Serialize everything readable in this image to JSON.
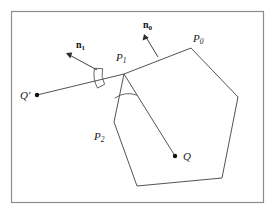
{
  "figure": {
    "background_color": "#ffffff",
    "border_color": "#8c8c8c",
    "line_color": "#3a3a3a",
    "label_color": "#1a1a1a",
    "frame": {
      "x": 11,
      "y": 11,
      "width": 253,
      "height": 192
    }
  },
  "labels": {
    "p0": {
      "text": "P",
      "sub": "0",
      "x": 193,
      "y": 33
    },
    "p1": {
      "text": "P",
      "sub": "1",
      "x": 116,
      "y": 52
    },
    "p2": {
      "text": "P",
      "sub": "2",
      "x": 94,
      "y": 131
    },
    "q": {
      "text": "Q",
      "sub": "",
      "x": 183,
      "y": 151
    },
    "qprime": {
      "text": "Q",
      "sub": "",
      "prime": "′",
      "x": 20,
      "y": 90
    },
    "n0": {
      "text": "n",
      "sub": "0",
      "x": 143,
      "y": 20
    },
    "n1": {
      "text": "n",
      "sub": "1",
      "x": 76,
      "y": 40
    }
  },
  "geometry": {
    "polygon_vertices": [
      {
        "name": "P1",
        "x": 124,
        "y": 74
      },
      {
        "name": "P0",
        "x": 191,
        "y": 48
      },
      {
        "name": "V3",
        "x": 238,
        "y": 97
      },
      {
        "name": "V4",
        "x": 222,
        "y": 178
      },
      {
        "name": "V5",
        "x": 137,
        "y": 186
      },
      {
        "name": "P2",
        "x": 114,
        "y": 122
      }
    ],
    "points": [
      {
        "name": "Q",
        "x": 175,
        "y": 156
      },
      {
        "name": "Qprime",
        "x": 37,
        "y": 95
      }
    ],
    "rays": [
      {
        "name": "P1-to-Q",
        "x1": 124,
        "y1": 74,
        "x2": 175,
        "y2": 156
      },
      {
        "name": "P1-to-Qprime",
        "x1": 124,
        "y1": 74,
        "x2": 37,
        "y2": 95
      }
    ],
    "normals": [
      {
        "name": "n0",
        "x1": 158,
        "y1": 57,
        "x2": 144,
        "y2": 34
      },
      {
        "name": "n1",
        "x1": 97,
        "y1": 70,
        "x2": 66,
        "y2": 53
      }
    ],
    "angle_arcs": [
      {
        "name": "arc-n1-upper",
        "cx": 124,
        "cy": 74,
        "r": 30,
        "a1": 191,
        "a2": 208
      },
      {
        "name": "arc-n1-lower",
        "cx": 124,
        "cy": 74,
        "r": 22,
        "a1": 166,
        "a2": 208
      },
      {
        "name": "arc-q-lower",
        "cx": 124,
        "cy": 74,
        "r": 25,
        "a1": 58,
        "a2": 112
      }
    ]
  }
}
